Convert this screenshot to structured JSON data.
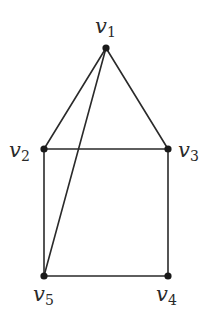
{
  "graph": {
    "title": "",
    "vertices": [
      {
        "id": "v1",
        "label": "v",
        "sub": "1",
        "x": 106,
        "y": 48
      },
      {
        "id": "v2",
        "label": "v",
        "sub": "2",
        "x": 44,
        "y": 149
      },
      {
        "id": "v3",
        "label": "v",
        "sub": "3",
        "x": 168,
        "y": 149
      },
      {
        "id": "v4",
        "label": "v",
        "sub": "4",
        "x": 168,
        "y": 276
      },
      {
        "id": "v5",
        "label": "v",
        "sub": "5",
        "x": 44,
        "y": 276
      }
    ],
    "edges": [
      [
        "v1",
        "v2"
      ],
      [
        "v1",
        "v3"
      ],
      [
        "v1",
        "v5"
      ],
      [
        "v2",
        "v3"
      ],
      [
        "v2",
        "v5"
      ],
      [
        "v3",
        "v4"
      ],
      [
        "v4",
        "v5"
      ]
    ],
    "colors": {
      "edge": "#2a2a2a",
      "vertex": "#1a1a1a",
      "background": "#ffffff"
    }
  }
}
